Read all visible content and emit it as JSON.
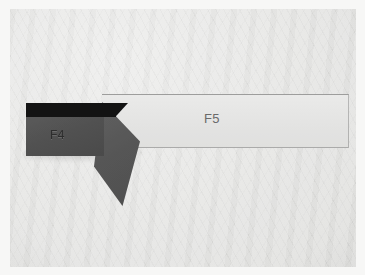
{
  "figure": {
    "kind": "photograph",
    "background": "woven cloth backdrop",
    "labels": {
      "tool_holder": "F4",
      "workpiece_panel": "F5"
    },
    "colors": {
      "backdrop": "#f1f1ef",
      "photo_margin": "#f7f7f6",
      "shank_top": "#141414",
      "holder_body": "#444444",
      "insert": "#4a4a4a",
      "panel_fill": "#efefee",
      "panel_outline": "#5a5a5a",
      "label_text": "#6f6f6f",
      "edge_tick": "#3a3a3a"
    },
    "parts": [
      {
        "name": "shank-top-layer",
        "label": ""
      },
      {
        "name": "tool-holder-body",
        "label": "F4"
      },
      {
        "name": "angled-cutting-insert",
        "label": ""
      },
      {
        "name": "workpiece-panel",
        "label": "F5"
      },
      {
        "name": "panel-right-edge-tick",
        "label": ""
      }
    ]
  }
}
